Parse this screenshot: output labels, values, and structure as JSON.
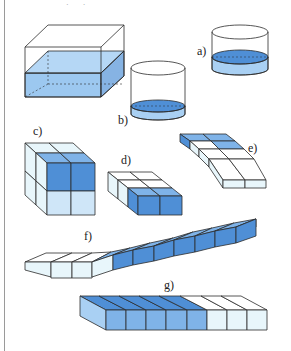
{
  "figure": {
    "top_marks": "· ·",
    "labels": {
      "a": "a)",
      "b": "b)",
      "c": "c)",
      "d": "d)",
      "e": "e)",
      "f": "f)",
      "g": "g)"
    },
    "colors": {
      "dark_blue": "#4f8fd6",
      "mid_blue": "#7fb3e8",
      "light_blue": "#a9d0f3",
      "pale": "#e8f6fb",
      "outline": "#2b2b2b"
    },
    "items": [
      {
        "id": "main",
        "shape": "rectangular-prism-container",
        "fill": "about half filled with water"
      },
      {
        "id": "a",
        "shape": "cylinder",
        "fill": "about half filled"
      },
      {
        "id": "b",
        "shape": "cylinder",
        "fill": "about one third filled"
      },
      {
        "id": "c",
        "shape": "2x2x2 cube",
        "shaded_cubes": 4,
        "total_cubes": 8
      },
      {
        "id": "d",
        "shape": "2x3x1 block",
        "shaded_cubes": 2,
        "total_cubes": 6
      },
      {
        "id": "e",
        "shape": "2x4x1 slab",
        "shaded_cubes": 3,
        "total_cubes": 8
      },
      {
        "id": "f",
        "shape": "1x12 strip",
        "shaded_cubes": 8,
        "total_cubes": 12
      },
      {
        "id": "g",
        "shape": "1x8 strip",
        "shaded_cubes": 5,
        "total_cubes": 8
      }
    ]
  }
}
